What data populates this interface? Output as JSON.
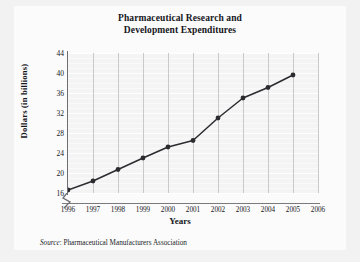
{
  "figure": {
    "background_color": "#f2f2f2",
    "panel_color": "#fbfbfb",
    "plot_background_color": "#f4f4f4",
    "line_color": "#2b2b30",
    "grid_color": "#ffffff",
    "vertical_grid_color": "#c9c9c9",
    "axis_color": "#6e6e72"
  },
  "source": {
    "prefix": "Source",
    "separator": ": ",
    "text": "Pharmaceutical Manufacturers Association"
  },
  "chart_data": {
    "type": "line",
    "title": "Pharmaceutical Research and Development Expenditures",
    "title_line_1": "Pharmaceutical Research and",
    "title_line_2": "Development Expenditures",
    "xlabel": "Years",
    "ylabel": "Dollars (in billions)",
    "categories": [
      "1996",
      "1997",
      "1998",
      "1999",
      "2000",
      "2001",
      "2002",
      "2003",
      "2004",
      "2005"
    ],
    "values": [
      16.6,
      18.4,
      20.7,
      23.0,
      25.2,
      26.5,
      31.0,
      35.0,
      37.1,
      39.6
    ],
    "x_tick_labels": [
      "1996",
      "1997",
      "1998",
      "1999",
      "2000",
      "2001",
      "2002",
      "2003",
      "2004",
      "2005",
      "2006"
    ],
    "y_tick_labels": [
      "44",
      "40",
      "36",
      "32",
      "28",
      "24",
      "20",
      "16"
    ],
    "ylim": [
      16,
      44
    ],
    "xlim": [
      "1996",
      "2006"
    ],
    "y_axis_broken": true,
    "grid": true,
    "legend": "none",
    "marker": "filled-circle"
  }
}
